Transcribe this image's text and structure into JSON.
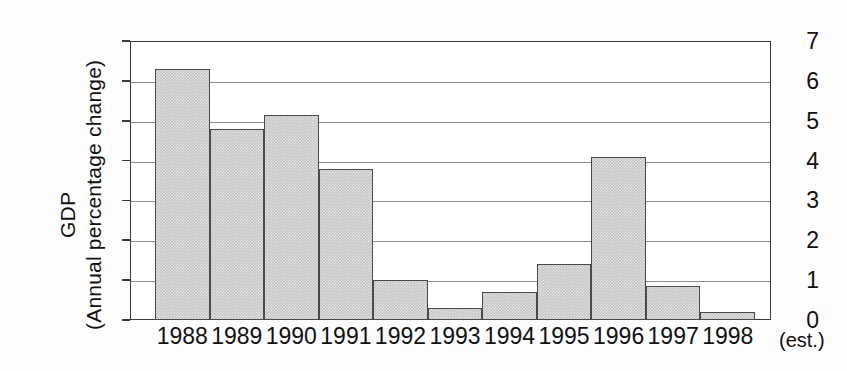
{
  "chart_data": {
    "type": "bar",
    "title": "",
    "subtitle": "",
    "xlabel": "",
    "ylabel": "GDP (Annual percentage change)",
    "ylabel_lines": [
      "GDP",
      "(Annual percentage change)"
    ],
    "categories": [
      "1988",
      "1989",
      "1990",
      "1991",
      "1992",
      "1993",
      "1994",
      "1995",
      "1996",
      "1997",
      "1998"
    ],
    "values": [
      6.3,
      4.8,
      5.15,
      3.8,
      1.0,
      0.3,
      0.7,
      1.4,
      4.1,
      0.85,
      0.2
    ],
    "series": [
      {
        "name": "GDP annual percentage change",
        "values": [
          6.3,
          4.8,
          5.15,
          3.8,
          1.0,
          0.3,
          0.7,
          1.4,
          4.1,
          0.85,
          0.2
        ]
      }
    ],
    "ylim": [
      0,
      7
    ],
    "ytick_labels": [
      "7",
      "6",
      "5",
      "4",
      "3",
      "2",
      "1",
      "0"
    ],
    "ytick_values": [
      7,
      6,
      5,
      4,
      3,
      2,
      1,
      0
    ],
    "grid": true,
    "grid_axis": "y",
    "legend": false,
    "legend_position": "none",
    "annotations": [
      {
        "name": "estimate-note",
        "text": "(est.)",
        "applies_to": "1998"
      }
    ],
    "bar_fill_color": "#c4c4c4",
    "bar_border_color": "#4a4a4a",
    "axis_color": "#3a3a3a",
    "grid_color": "#8c8c8c",
    "background_color": "#fdfdfd"
  }
}
